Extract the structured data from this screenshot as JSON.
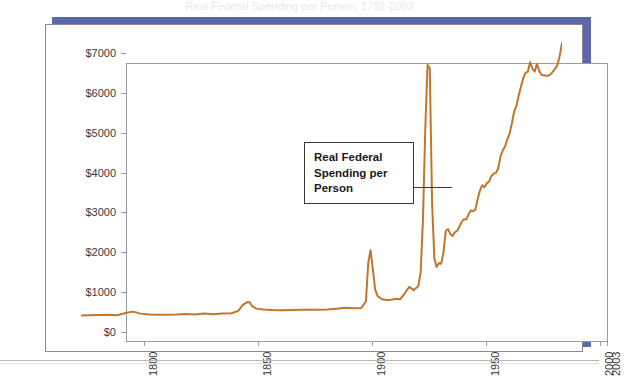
{
  "page": {
    "clipped_caption": "Real Federal Spending per Person, 1792-2003",
    "background_color": "#ffffff"
  },
  "frame": {
    "accent_color": "#5b68ae",
    "card_border_color": "#8a8a8a"
  },
  "annotation": {
    "name": "real-federal-spending-callout",
    "line1": "Real Federal",
    "line2": "Spending per",
    "line3": "Person",
    "text": "Real Federal Spending per Person",
    "border_color": "#3a3a3a"
  },
  "chart_data": {
    "type": "line",
    "title": "",
    "subtitle": "",
    "xlabel": "",
    "ylabel": "",
    "xlim": [
      1792,
      2003
    ],
    "ylim": [
      0,
      7000
    ],
    "grid": false,
    "legend": null,
    "legend_position": "none",
    "line_color": "#c2762b",
    "line_width": 2,
    "y_tick_labels": [
      "$0",
      "$1000",
      "$2000",
      "$3000",
      "$4000",
      "$5000",
      "$6000",
      "$7000"
    ],
    "y_tick_values": [
      0,
      1000,
      2000,
      3000,
      4000,
      5000,
      6000,
      7000
    ],
    "x_tick_labels": [
      "1800",
      "1850",
      "1900",
      "1950",
      "2000",
      "2003"
    ],
    "x_tick_values": [
      1800,
      1850,
      1900,
      1950,
      2000,
      2003
    ],
    "annotations": [
      {
        "text": "Real Federal Spending per Person",
        "points_to_year": 1941,
        "points_to_value": 4000
      }
    ],
    "series": [
      {
        "name": "Real Federal Spending per Person",
        "color": "#c2762b",
        "x": [
          1792,
          1796,
          1800,
          1804,
          1808,
          1812,
          1815,
          1818,
          1822,
          1826,
          1830,
          1834,
          1838,
          1842,
          1846,
          1850,
          1854,
          1858,
          1861,
          1863,
          1865,
          1866,
          1867,
          1869,
          1872,
          1876,
          1880,
          1884,
          1888,
          1892,
          1896,
          1900,
          1904,
          1908,
          1912,
          1915,
          1917,
          1918,
          1919,
          1920,
          1921,
          1922,
          1924,
          1926,
          1928,
          1930,
          1932,
          1934,
          1936,
          1938,
          1940,
          1941,
          1942,
          1943,
          1944,
          1945,
          1946,
          1947,
          1948,
          1949,
          1950,
          1951,
          1952,
          1953,
          1954,
          1955,
          1956,
          1957,
          1958,
          1959,
          1960,
          1961,
          1962,
          1963,
          1964,
          1965,
          1966,
          1967,
          1968,
          1969,
          1970,
          1971,
          1972,
          1973,
          1974,
          1975,
          1976,
          1977,
          1978,
          1979,
          1980,
          1981,
          1982,
          1983,
          1984,
          1985,
          1986,
          1987,
          1988,
          1989,
          1990,
          1991,
          1992,
          1993,
          1994,
          1995,
          1996,
          1997,
          1998,
          1999,
          2000,
          2001,
          2002,
          2003
        ],
        "y": [
          60,
          70,
          75,
          80,
          70,
          130,
          160,
          110,
          85,
          80,
          80,
          85,
          100,
          90,
          110,
          95,
          110,
          120,
          180,
          330,
          400,
          395,
          300,
          235,
          215,
          200,
          195,
          200,
          205,
          205,
          210,
          215,
          230,
          255,
          245,
          250,
          420,
          1380,
          1700,
          1240,
          730,
          560,
          470,
          450,
          460,
          480,
          470,
          620,
          780,
          700,
          800,
          1150,
          2450,
          4700,
          6350,
          6260,
          2900,
          1500,
          1280,
          1380,
          1360,
          1640,
          2180,
          2230,
          2110,
          2060,
          2150,
          2190,
          2290,
          2410,
          2480,
          2470,
          2600,
          2700,
          2680,
          2720,
          2980,
          3200,
          3330,
          3280,
          3380,
          3420,
          3560,
          3620,
          3640,
          3750,
          4050,
          4200,
          4300,
          4480,
          4620,
          4880,
          5180,
          5320,
          5580,
          5800,
          6020,
          6150,
          6180,
          6420,
          6260,
          6180,
          6380,
          6200,
          6100,
          6090,
          6080,
          6080,
          6110,
          6180,
          6260,
          6350,
          6580,
          6900
        ]
      }
    ]
  }
}
